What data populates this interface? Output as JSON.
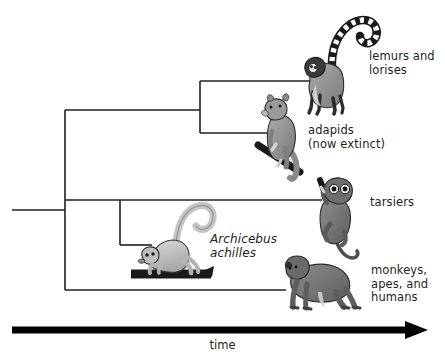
{
  "figure": {
    "type": "phylogenetic-tree",
    "title": "",
    "background_color": "#ffffff",
    "line_color": "#231f20",
    "axis": {
      "label": "time",
      "direction": "left-to-right",
      "arrow": true,
      "x_start": 12,
      "x_end": 427,
      "y": 330
    }
  },
  "tips": [
    {
      "id": "lemurs",
      "label": "lemurs and\nlorises",
      "illustration": "ring-tailed-lemur-icon",
      "branch_y": 81,
      "branch_x_end": 325
    },
    {
      "id": "adapids",
      "label": "adapids\n(now extinct)",
      "illustration": "adapid-primate-icon",
      "branch_y": 133,
      "branch_x_end": 286
    },
    {
      "id": "tarsiers",
      "label": "tarsiers",
      "illustration": "tarsier-icon",
      "branch_y": 200,
      "branch_x_end": 322
    },
    {
      "id": "archicebus",
      "label": "Archicebus\nachilles",
      "illustration": "archicebus-icon",
      "branch_y": 245,
      "branch_x_end": 150
    },
    {
      "id": "monkeys",
      "label": "monkeys,\napes, and\nhumans",
      "illustration": "ape-icon",
      "branch_y": 290,
      "branch_x_end": 286
    }
  ],
  "nodes": [
    {
      "id": "root",
      "x": 65,
      "y_top": 110,
      "y_bottom": 200,
      "stem_x_start": 12,
      "stem_y": 210
    },
    {
      "id": "strepsirrhine-node",
      "x": 200,
      "y_top": 81,
      "y_bottom": 133
    },
    {
      "id": "haplorhine-node",
      "x": 65,
      "y_top": 200,
      "y_bottom": 290
    },
    {
      "id": "tarsier-archicebus-node",
      "x": 120,
      "y_top": 200,
      "y_bottom": 245
    }
  ]
}
